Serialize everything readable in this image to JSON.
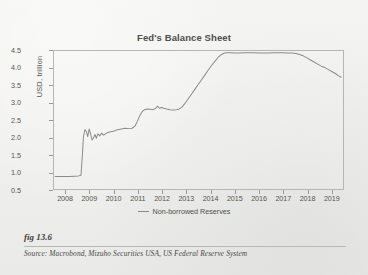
{
  "figure": {
    "number_label": "fig 13.6",
    "source_text": "Source: Macrobond, Mizuho Securities USA, US Federal Reserve System"
  },
  "colors": {
    "series_line": "#8c8c86",
    "axis": "#b6b6b2",
    "text": "#55554f",
    "page_background": "#f2f2f0"
  },
  "chart_data": {
    "type": "line",
    "title": "Fed's Balance Sheet",
    "xlabel": "",
    "ylabel": "USD, trillion",
    "ylim": [
      0.5,
      4.5
    ],
    "xlim": [
      2007.5,
      2019.5
    ],
    "grid": false,
    "legend_position": "bottom-center",
    "y_ticks": [
      "0.5",
      "1.0",
      "1.5",
      "2.0",
      "2.5",
      "3.0",
      "3.5",
      "4.0",
      "4.5"
    ],
    "x_ticks": [
      "2008",
      "2009",
      "2010",
      "2011",
      "2012",
      "2013",
      "2014",
      "2015",
      "2016",
      "2017",
      "2018",
      "2019"
    ],
    "series": [
      {
        "name": "Non-borrowed Reserves",
        "color": "#8c8c86",
        "points": [
          [
            2007.55,
            0.86
          ],
          [
            2007.75,
            0.86
          ],
          [
            2007.95,
            0.86
          ],
          [
            2008.15,
            0.86
          ],
          [
            2008.35,
            0.87
          ],
          [
            2008.52,
            0.88
          ],
          [
            2008.62,
            0.9
          ],
          [
            2008.68,
            1.5
          ],
          [
            2008.72,
            2.0
          ],
          [
            2008.78,
            2.22
          ],
          [
            2008.84,
            2.18
          ],
          [
            2008.9,
            2.02
          ],
          [
            2008.96,
            2.24
          ],
          [
            2009.02,
            2.1
          ],
          [
            2009.08,
            1.92
          ],
          [
            2009.14,
            1.98
          ],
          [
            2009.2,
            2.08
          ],
          [
            2009.26,
            1.97
          ],
          [
            2009.32,
            2.1
          ],
          [
            2009.4,
            2.04
          ],
          [
            2009.48,
            2.12
          ],
          [
            2009.56,
            2.06
          ],
          [
            2009.64,
            2.1
          ],
          [
            2009.74,
            2.14
          ],
          [
            2009.86,
            2.16
          ],
          [
            2010.0,
            2.18
          ],
          [
            2010.14,
            2.22
          ],
          [
            2010.3,
            2.24
          ],
          [
            2010.46,
            2.26
          ],
          [
            2010.6,
            2.25
          ],
          [
            2010.74,
            2.26
          ],
          [
            2010.86,
            2.32
          ],
          [
            2010.96,
            2.46
          ],
          [
            2011.06,
            2.62
          ],
          [
            2011.16,
            2.74
          ],
          [
            2011.26,
            2.8
          ],
          [
            2011.38,
            2.82
          ],
          [
            2011.5,
            2.81
          ],
          [
            2011.62,
            2.8
          ],
          [
            2011.72,
            2.84
          ],
          [
            2011.8,
            2.9
          ],
          [
            2011.88,
            2.84
          ],
          [
            2011.96,
            2.86
          ],
          [
            2012.06,
            2.84
          ],
          [
            2012.18,
            2.82
          ],
          [
            2012.32,
            2.8
          ],
          [
            2012.46,
            2.79
          ],
          [
            2012.58,
            2.8
          ],
          [
            2012.7,
            2.82
          ],
          [
            2012.82,
            2.88
          ],
          [
            2012.94,
            2.98
          ],
          [
            2013.06,
            3.1
          ],
          [
            2013.2,
            3.24
          ],
          [
            2013.34,
            3.38
          ],
          [
            2013.48,
            3.52
          ],
          [
            2013.62,
            3.66
          ],
          [
            2013.76,
            3.8
          ],
          [
            2013.9,
            3.94
          ],
          [
            2014.04,
            4.08
          ],
          [
            2014.18,
            4.2
          ],
          [
            2014.32,
            4.32
          ],
          [
            2014.46,
            4.4
          ],
          [
            2014.58,
            4.44
          ],
          [
            2014.7,
            4.45
          ],
          [
            2014.84,
            4.45
          ],
          [
            2015.0,
            4.44
          ],
          [
            2015.2,
            4.44
          ],
          [
            2015.4,
            4.45
          ],
          [
            2015.6,
            4.45
          ],
          [
            2015.8,
            4.45
          ],
          [
            2016.0,
            4.44
          ],
          [
            2016.2,
            4.44
          ],
          [
            2016.4,
            4.44
          ],
          [
            2016.6,
            4.45
          ],
          [
            2016.8,
            4.45
          ],
          [
            2017.0,
            4.45
          ],
          [
            2017.2,
            4.44
          ],
          [
            2017.4,
            4.44
          ],
          [
            2017.55,
            4.43
          ],
          [
            2017.7,
            4.4
          ],
          [
            2017.85,
            4.36
          ],
          [
            2018.0,
            4.3
          ],
          [
            2018.15,
            4.24
          ],
          [
            2018.3,
            4.18
          ],
          [
            2018.45,
            4.12
          ],
          [
            2018.6,
            4.06
          ],
          [
            2018.75,
            4.02
          ],
          [
            2018.9,
            3.96
          ],
          [
            2019.05,
            3.9
          ],
          [
            2019.2,
            3.84
          ],
          [
            2019.32,
            3.78
          ],
          [
            2019.42,
            3.74
          ]
        ]
      }
    ]
  }
}
